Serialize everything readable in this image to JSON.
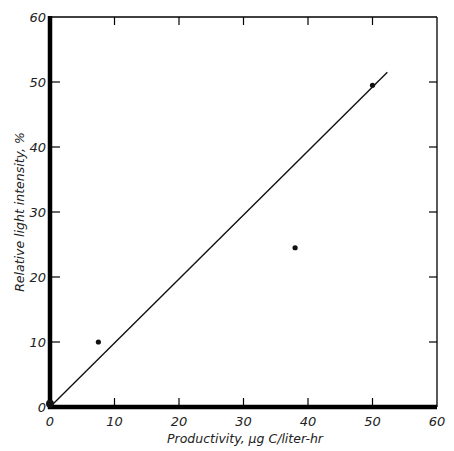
{
  "chart_data": {
    "type": "scatter",
    "title": "",
    "xlabel": "Productivity, μg C/liter-hr",
    "ylabel": "Relative light intensity, %",
    "xlim": [
      0,
      60
    ],
    "ylim": [
      0,
      60
    ],
    "xticks": [
      0,
      10,
      20,
      30,
      40,
      50,
      60
    ],
    "yticks": [
      0,
      10,
      20,
      30,
      40,
      50,
      60
    ],
    "xtick_labels": [
      "0",
      "10",
      "20",
      "30",
      "40",
      "50",
      "60"
    ],
    "ytick_labels": [
      "0",
      "10",
      "20",
      "30",
      "40",
      "50",
      "60"
    ],
    "grid": false,
    "legend": null,
    "series": [
      {
        "name": "observations",
        "type": "scatter",
        "x": [
          0,
          7.5,
          38,
          50
        ],
        "y": [
          0.5,
          10,
          24.5,
          49.5
        ]
      },
      {
        "name": "fitted line",
        "type": "line",
        "x": [
          0,
          52.3
        ],
        "y": [
          0,
          51.5
        ]
      }
    ]
  },
  "colors": {
    "axis": "#000000",
    "data": "#111111",
    "background": "#ffffff"
  }
}
